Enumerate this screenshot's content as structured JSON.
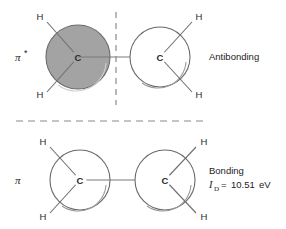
{
  "diagram": {
    "background_color": "#ffffff",
    "lobe_fill_shaded": "#a0a0a0",
    "lobe_fill_plain": "#ffffff",
    "stroke_color": "#6f6f6f",
    "text_color": "#1c1c1c"
  },
  "antibonding": {
    "orbital_symbol": "π",
    "orbital_star": "*",
    "side_label": "Antibonding",
    "left_atom": {
      "center_label": "C",
      "hydrogens": [
        "H",
        "H"
      ]
    },
    "right_atom": {
      "center_label": "C",
      "hydrogens": [
        "H",
        "H"
      ]
    },
    "node_line": "vertical-dashed-node"
  },
  "bonding": {
    "orbital_symbol": "π",
    "side_label": "Bonding",
    "energy": {
      "variable": "I",
      "subscript": "D",
      "equals": "=",
      "value": "10.51",
      "unit": "eV",
      "full_text": "I_D = 10.51 eV"
    },
    "left_atom": {
      "center_label": "C",
      "hydrogens": [
        "H",
        "H"
      ]
    },
    "right_atom": {
      "center_label": "C",
      "hydrogens": [
        "H",
        "H"
      ]
    }
  },
  "divider": {
    "style": "horizontal-dashed"
  }
}
